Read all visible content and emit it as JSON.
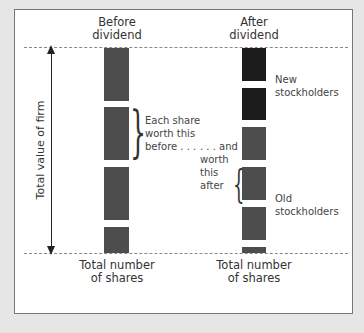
{
  "diagram": {
    "columns": [
      {
        "title_line1": "Before",
        "title_line2": "dividend",
        "bottom_line1": "Total number",
        "bottom_line2": "of shares",
        "bars": [
          {
            "group": "old"
          },
          {
            "group": "old"
          },
          {
            "group": "old"
          },
          {
            "group": "old"
          }
        ]
      },
      {
        "title_line1": "After",
        "title_line2": "dividend",
        "bottom_line1": "Total number",
        "bottom_line2": "of shares",
        "bars": [
          {
            "group": "new"
          },
          {
            "group": "new"
          },
          {
            "group": "old"
          },
          {
            "group": "old"
          },
          {
            "group": "old"
          },
          {
            "group": "old"
          }
        ]
      }
    ],
    "axis_label": "Total value of firm",
    "annotations": {
      "before_line1": "Each share",
      "before_line2": "worth this",
      "before_line3": "before . . .",
      "after_line1": ". . . and",
      "after_line2": "worth",
      "after_line3": "this",
      "after_line4": "after",
      "new_line1": "New",
      "new_line2": "stockholders",
      "old_line1": "Old",
      "old_line2": "stockholders"
    },
    "colors": {
      "old_shares": "#4d4d4d",
      "new_shares": "#1c1c1c",
      "background": "#ffffff",
      "frame": "#e6e6e6"
    }
  }
}
